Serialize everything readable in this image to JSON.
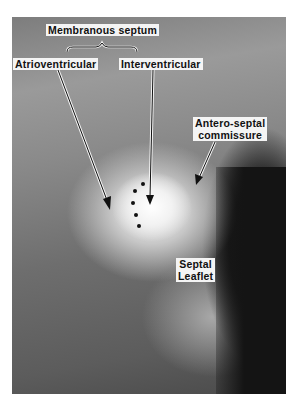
{
  "figure": {
    "labels": {
      "membranous_septum": "Membranous septum",
      "atrioventricular": "Atrioventricular",
      "interventricular": "Interventricular",
      "antero_septal_line1": "Antero-septal",
      "antero_septal_line2": "commissure",
      "septal_line1": "Septal",
      "septal_line2": "Leaflet"
    },
    "annotations": {
      "dots_count": 5,
      "arrows": [
        "atrioventricular-arrow",
        "interventricular-arrow",
        "antero-septal-commissure-arrow"
      ],
      "brace": "membranous-septum-brace"
    }
  }
}
